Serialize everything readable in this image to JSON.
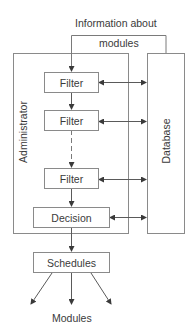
{
  "diagram": {
    "feedback_label_line1": "Information about",
    "feedback_label_line2": "modules",
    "container_left_label": "Administrator",
    "container_right_label": "Database",
    "nodes": [
      {
        "id": "filter1",
        "label": "Filter"
      },
      {
        "id": "filter2",
        "label": "Filter"
      },
      {
        "id": "filter3",
        "label": "Filter"
      },
      {
        "id": "decision",
        "label": "Decision"
      },
      {
        "id": "schedules",
        "label": "Schedules"
      }
    ],
    "output_label": "Modules",
    "edges": [
      {
        "from": "database",
        "to": "filter1",
        "label": "Information about modules",
        "type": "feedback"
      },
      {
        "from": "filter1",
        "to": "filter2",
        "type": "solid"
      },
      {
        "from": "filter2",
        "to": "filter3",
        "type": "dashed"
      },
      {
        "from": "filter3",
        "to": "decision",
        "type": "solid"
      },
      {
        "from": "decision",
        "to": "schedules",
        "type": "solid"
      },
      {
        "from": "filter1",
        "to": "database",
        "type": "bidirectional"
      },
      {
        "from": "filter2",
        "to": "database",
        "type": "bidirectional"
      },
      {
        "from": "filter3",
        "to": "database",
        "type": "bidirectional"
      },
      {
        "from": "decision",
        "to": "database",
        "type": "bidirectional"
      },
      {
        "from": "schedules",
        "to": "modules",
        "type": "fan-out",
        "count": 3
      }
    ],
    "colors": {
      "line": "#5a5a5a",
      "box_border": "#8a8a8a",
      "text": "#3a3a3a"
    }
  }
}
